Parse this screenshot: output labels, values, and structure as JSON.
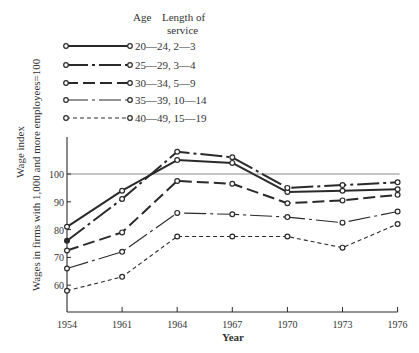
{
  "chart_data": {
    "type": "line",
    "title": "",
    "xlabel": "Year",
    "ylabel": "Wage index",
    "ylabel_sub": "Wages in firms with 1,000 and more employees=100",
    "x": [
      1954,
      1961,
      1964,
      1967,
      1970,
      1973,
      1976
    ],
    "x_tick_labels": [
      "1954",
      "1961",
      "1964",
      "1967",
      "1970",
      "1973",
      "1976"
    ],
    "y_ticks": [
      60,
      70,
      80,
      90,
      100
    ],
    "ylim": [
      50,
      113
    ],
    "reference_line": 100,
    "grid": false,
    "legend_position": "top",
    "legend_header": {
      "age": "Age",
      "service_line1": "Length of",
      "service_line2": "service"
    },
    "series": [
      {
        "name": "20—24,  2—3",
        "age": "20—24",
        "service": "2—3",
        "style": "solid",
        "weight": "heavy",
        "values": [
          81,
          94,
          105,
          104,
          93.5,
          94,
          94.5
        ]
      },
      {
        "name": "25—29,  3—4",
        "age": "25—29",
        "service": "3—4",
        "style": "dash-dot",
        "weight": "heavy",
        "values": [
          76,
          91,
          108,
          106,
          95,
          96,
          97
        ]
      },
      {
        "name": "30—34,  5—9",
        "age": "30—34",
        "service": "5—9",
        "style": "long-dash",
        "weight": "heavy",
        "values": [
          72.5,
          79,
          97.5,
          96.5,
          89.5,
          90.5,
          92.5
        ]
      },
      {
        "name": "35—39,  10—14",
        "age": "35—39",
        "service": "10—14",
        "style": "dash-dot",
        "weight": "light",
        "values": [
          66,
          72,
          86,
          85.5,
          84.5,
          82.5,
          86.5
        ]
      },
      {
        "name": "40—49,  15—19",
        "age": "40—49",
        "service": "15—19",
        "style": "short-dash",
        "weight": "light",
        "values": [
          58,
          63,
          77.5,
          77.5,
          77.5,
          73.5,
          82
        ]
      }
    ]
  },
  "colors": {
    "ink": "#2a2a2a",
    "reference": "#8a8a8a",
    "background": "#ffffff"
  }
}
